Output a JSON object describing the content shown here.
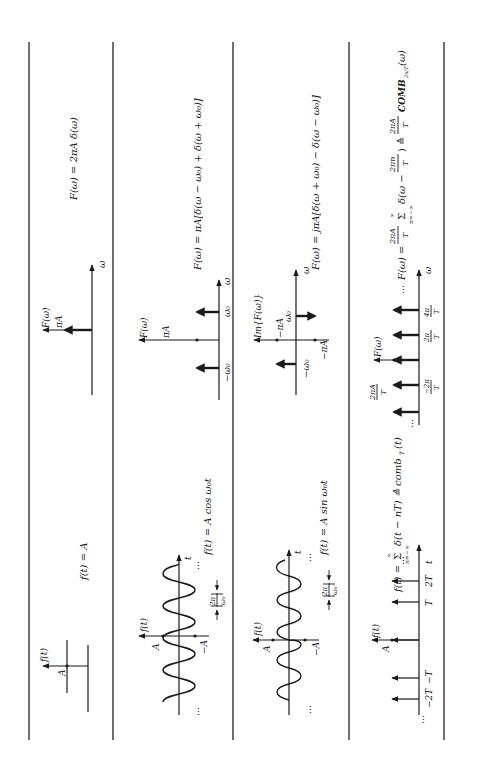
{
  "page": {
    "orientation": "rotated-90-ccw"
  },
  "rows": [
    {
      "name": "constant",
      "time": {
        "formula": "f(t) = A",
        "axis_label": "f(t)",
        "level_label": "A"
      },
      "freq": {
        "formula": "F(ω) = 2πA δ(ω)",
        "axis_label": "F(ω)",
        "impulse_label": "πA",
        "w_label": "ω"
      }
    },
    {
      "name": "cosine",
      "time": {
        "formula": "f(t) = A cos ω₀t",
        "axis_label": "f(t)",
        "t_label": "t",
        "pos_label": "A",
        "neg_label": "−A",
        "period_num": "2π",
        "period_den": "ω₀",
        "ellipsis": "…"
      },
      "freq": {
        "formula": "F(ω) = πA[δ(ω − ω₀) + δ(ω + ω₀)]",
        "axis_label": "F(ω)",
        "impulse_label": "πA",
        "pos_w": "ω₀",
        "neg_w": "−ω₀",
        "w_label": "ω"
      }
    },
    {
      "name": "sine",
      "time": {
        "formula": "f(t) = A sin ω₀t",
        "axis_label": "f(t)",
        "t_label": "t",
        "pos_label": "A",
        "neg_label": "−A",
        "period_num": "2π",
        "period_den": "ω₀",
        "ellipsis": "…"
      },
      "freq": {
        "formula": "F(ω) = jπA[δ(ω + ω₀) − δ(ω − ω₀)]",
        "axis_label": "Im{F(ω)}",
        "upper_label": "−πA",
        "lower_label": "−πA",
        "pos_w": "ω₀",
        "neg_w": "−ω₀",
        "w_label": "ω"
      }
    },
    {
      "name": "comb",
      "time": {
        "formula_lhs": "f(t) =",
        "formula_sum": "Σ",
        "formula_sum_top": "∞",
        "formula_sum_bottom": "n=−∞",
        "formula_rhs": "δ(t − nT) ≙ comb",
        "formula_sub": "T",
        "formula_end": "(t)",
        "axis_label": "f(t)",
        "level_label": "A",
        "ticks": [
          "−2T",
          "−T",
          "T",
          "2T"
        ],
        "t_label": "t",
        "ellipsis": "…"
      },
      "freq": {
        "formula_lhs": "F(ω) =",
        "coef_num": "2πA",
        "coef_den": "T",
        "formula_sum": "Σ",
        "formula_sum_top": "∞",
        "formula_sum_bottom": "n=−∞",
        "formula_mid": "δ(ω −",
        "inner_num": "2πn",
        "inner_den": "T",
        "formula_eq": ") ≙",
        "coef2_num": "2πA",
        "coef2_den": "T",
        "formula_end": "COMB",
        "formula_sub": "2π/T",
        "formula_arg": "(ω)",
        "axis_label": "F(ω)",
        "height_num": "2πA",
        "height_den": "T",
        "ticks": [
          {
            "num": "−2π",
            "den": "T"
          },
          {
            "num": "2π",
            "den": "T"
          },
          {
            "num": "4π",
            "den": "T"
          }
        ],
        "w_label": "ω",
        "ellipsis": "…"
      }
    }
  ]
}
